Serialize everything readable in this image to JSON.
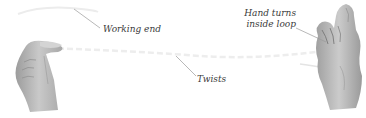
{
  "diagram": {
    "type": "illustration",
    "labels": {
      "working_end": "Working end",
      "twists": "Twists",
      "hand_turns_line1": "Hand turns",
      "hand_turns_line2": "inside loop"
    },
    "elements": [
      {
        "name": "left-hand",
        "description": "left hand pinching rope end"
      },
      {
        "name": "right-hand",
        "description": "right hand with rope loop around fingers"
      },
      {
        "name": "rope",
        "description": "faint rope strand running between hands"
      }
    ],
    "colors": {
      "background": "#ffffff",
      "skin_light": "#d8d8d8",
      "skin_mid": "#b5b5b5",
      "skin_dark": "#8a8a8a",
      "rope": "#e6e6e6",
      "leader_line": "#9a9a9a",
      "label_text": "#3a3a3a"
    }
  }
}
